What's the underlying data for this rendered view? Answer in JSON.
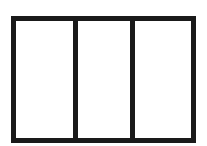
{
  "diagram": {
    "type": "three-panel-window",
    "panels": 3,
    "stroke_color": "#1a1a1a",
    "fill_color": "#ffffff"
  }
}
